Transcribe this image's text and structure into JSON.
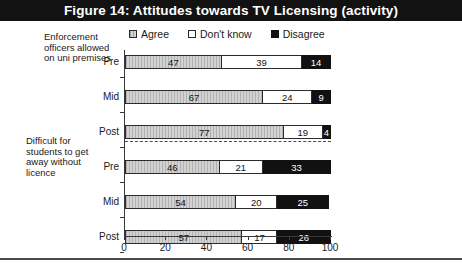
{
  "title": "Figure 14: Attitudes towards TV Licensing (activity)",
  "legend": {
    "position": "top",
    "items": [
      {
        "label": "Agree",
        "swatch": "hatched-grey",
        "color": "#d2d2d2"
      },
      {
        "label": "Don't know",
        "swatch": "white",
        "color": "#ffffff"
      },
      {
        "label": "Disagree",
        "swatch": "black",
        "color": "#111111"
      }
    ]
  },
  "groups": [
    {
      "caption": "Enforcement officers allowed on uni premises"
    },
    {
      "caption": "Difficult for students to get away without licence"
    }
  ],
  "axis": {
    "xticks": [
      0,
      20,
      40,
      60,
      80,
      100
    ],
    "xtick_labels": [
      "0",
      "20",
      "40",
      "60",
      "80",
      "100"
    ],
    "categories": [
      "Pre",
      "Mid",
      "Post"
    ]
  },
  "chart_data": {
    "type": "bar",
    "orientation": "horizontal",
    "stacked": true,
    "stack_total": 100,
    "title": "Figure 14: Attitudes towards TV Licensing (activity)",
    "xlabel": "",
    "ylabel": "",
    "xlim": [
      0,
      100
    ],
    "grid": false,
    "legend_position": "top",
    "series": [
      {
        "name": "Agree",
        "values": [
          47,
          67,
          77,
          46,
          54,
          57
        ]
      },
      {
        "name": "Don't know",
        "values": [
          39,
          24,
          19,
          21,
          20,
          17
        ]
      },
      {
        "name": "Disagree",
        "values": [
          14,
          9,
          4,
          33,
          25,
          26
        ]
      }
    ],
    "categories": [
      "Pre",
      "Mid",
      "Post",
      "Pre",
      "Mid",
      "Post"
    ],
    "groups": [
      {
        "label": "Enforcement officers allowed on uni premises",
        "rows": [
          {
            "category": "Pre",
            "Agree": 47,
            "Don't know": 39,
            "Disagree": 14
          },
          {
            "category": "Mid",
            "Agree": 67,
            "Don't know": 24,
            "Disagree": 9
          },
          {
            "category": "Post",
            "Agree": 77,
            "Don't know": 19,
            "Disagree": 4
          }
        ]
      },
      {
        "label": "Difficult for students to get away without licence",
        "rows": [
          {
            "category": "Pre",
            "Agree": 46,
            "Don't know": 21,
            "Disagree": 33
          },
          {
            "category": "Mid",
            "Agree": 54,
            "Don't know": 20,
            "Disagree": 25
          },
          {
            "category": "Post",
            "Agree": 57,
            "Don't know": 17,
            "Disagree": 26
          }
        ]
      }
    ]
  }
}
